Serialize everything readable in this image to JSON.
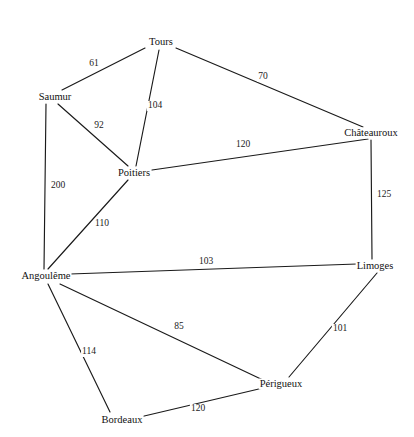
{
  "diagram": {
    "type": "weighted-undirected-graph",
    "title": "",
    "width": 414,
    "height": 437,
    "background_color": "#ffffff",
    "line_color": "#1a1a1a",
    "text_color": "#111111"
  },
  "nodes": [
    {
      "id": "tours",
      "label": "Tours",
      "x": 161,
      "y": 42
    },
    {
      "id": "saumur",
      "label": "Saumur",
      "x": 55,
      "y": 97
    },
    {
      "id": "poitiers",
      "label": "Poitiers",
      "x": 134,
      "y": 173
    },
    {
      "id": "chateauroux",
      "label": "Châteauroux",
      "x": 371,
      "y": 133
    },
    {
      "id": "limoges",
      "label": "Limoges",
      "x": 375,
      "y": 266
    },
    {
      "id": "angouleme",
      "label": "Angoulême",
      "x": 46,
      "y": 276
    },
    {
      "id": "perigueux",
      "label": "Périgueux",
      "x": 281,
      "y": 384
    },
    {
      "id": "bordeaux",
      "label": "Bordeaux",
      "x": 122,
      "y": 420
    }
  ],
  "edges": [
    {
      "id": "tours-saumur",
      "from": "tours",
      "to": "saumur",
      "weight": "61",
      "x1": 145,
      "y1": 48,
      "x2": 62,
      "y2": 90,
      "lx": 94,
      "ly": 64
    },
    {
      "id": "tours-chateauroux",
      "from": "tours",
      "to": "chateauroux",
      "weight": "70",
      "x1": 176,
      "y1": 48,
      "x2": 363,
      "y2": 127,
      "lx": 263,
      "ly": 77
    },
    {
      "id": "tours-poitiers",
      "from": "tours",
      "to": "poitiers",
      "weight": "104",
      "x1": 159,
      "y1": 50,
      "x2": 136,
      "y2": 166,
      "lx": 155,
      "ly": 106
    },
    {
      "id": "saumur-poitiers",
      "from": "saumur",
      "to": "poitiers",
      "weight": "92",
      "x1": 58,
      "y1": 104,
      "x2": 128,
      "y2": 166,
      "lx": 99,
      "ly": 126
    },
    {
      "id": "saumur-angouleme",
      "from": "saumur",
      "to": "angouleme",
      "weight": "200",
      "x1": 46,
      "y1": 104,
      "x2": 44,
      "y2": 269,
      "lx": 58,
      "ly": 186
    },
    {
      "id": "poitiers-chateauroux",
      "from": "poitiers",
      "to": "chateauroux",
      "weight": "120",
      "x1": 152,
      "y1": 170,
      "x2": 368,
      "y2": 139,
      "lx": 243,
      "ly": 145
    },
    {
      "id": "poitiers-angouleme",
      "from": "poitiers",
      "to": "angouleme",
      "weight": "110",
      "x1": 128,
      "y1": 180,
      "x2": 48,
      "y2": 269,
      "lx": 102,
      "ly": 224
    },
    {
      "id": "chateauroux-limoges",
      "from": "chateauroux",
      "to": "limoges",
      "weight": "125",
      "x1": 371,
      "y1": 140,
      "x2": 372,
      "y2": 259,
      "lx": 384,
      "ly": 195
    },
    {
      "id": "angouleme-limoges",
      "from": "angouleme",
      "to": "limoges",
      "weight": "103",
      "x1": 70,
      "y1": 274,
      "x2": 357,
      "y2": 264,
      "lx": 206,
      "ly": 262
    },
    {
      "id": "angouleme-perigueux",
      "from": "angouleme",
      "to": "perigueux",
      "weight": "85",
      "x1": 60,
      "y1": 284,
      "x2": 263,
      "y2": 380,
      "lx": 179,
      "ly": 327
    },
    {
      "id": "angouleme-bordeaux",
      "from": "angouleme",
      "to": "bordeaux",
      "weight": "114",
      "x1": 48,
      "y1": 284,
      "x2": 110,
      "y2": 412,
      "lx": 89,
      "ly": 352
    },
    {
      "id": "limoges-perigueux",
      "from": "limoges",
      "to": "perigueux",
      "weight": "101",
      "x1": 377,
      "y1": 273,
      "x2": 289,
      "y2": 377,
      "lx": 340,
      "ly": 329
    },
    {
      "id": "bordeaux-perigueux",
      "from": "bordeaux",
      "to": "perigueux",
      "weight": "120",
      "x1": 140,
      "y1": 417,
      "x2": 263,
      "y2": 388,
      "lx": 198,
      "ly": 409
    }
  ],
  "graph_data": {
    "type": "graph",
    "node_count": 8,
    "edge_count": 13,
    "adjacency": [
      [
        "Tours",
        "Saumur",
        61
      ],
      [
        "Tours",
        "Châteauroux",
        70
      ],
      [
        "Tours",
        "Poitiers",
        104
      ],
      [
        "Saumur",
        "Poitiers",
        92
      ],
      [
        "Saumur",
        "Angoulême",
        200
      ],
      [
        "Poitiers",
        "Châteauroux",
        120
      ],
      [
        "Poitiers",
        "Angoulême",
        110
      ],
      [
        "Châteauroux",
        "Limoges",
        125
      ],
      [
        "Angoulême",
        "Limoges",
        103
      ],
      [
        "Angoulême",
        "Périgueux",
        85
      ],
      [
        "Angoulême",
        "Bordeaux",
        114
      ],
      [
        "Limoges",
        "Périgueux",
        101
      ],
      [
        "Bordeaux",
        "Périgueux",
        120
      ]
    ]
  }
}
